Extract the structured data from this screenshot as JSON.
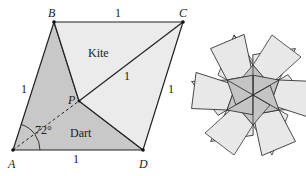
{
  "figure": {
    "labels": {
      "A": "A",
      "B": "B",
      "C": "C",
      "D": "D",
      "P": "P",
      "kite": "Kite",
      "dart": "Dart",
      "angle": "72°",
      "side_AB": "1",
      "side_BC": "1",
      "side_CD": "1",
      "side_AD": "1",
      "side_PC": "1"
    },
    "colors": {
      "dart_fill": "#c8c8c8",
      "kite_fill": "#ebebeb",
      "stroke": "#222222",
      "star_inner_fill": "#c4c4c4",
      "star_outer_fill": "#e8e8e8"
    }
  }
}
